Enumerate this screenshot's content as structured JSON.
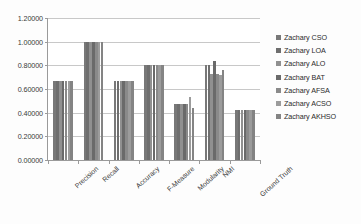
{
  "chart_data": {
    "type": "bar",
    "title": "",
    "xlabel": "",
    "ylabel": "",
    "ylim": [
      0,
      1.2
    ],
    "grid": true,
    "legend_position": "right",
    "categories": [
      "Precision",
      "Recall",
      "Accuracy",
      "F-Measure",
      "Modularity",
      "NMI",
      "Ground Truth"
    ],
    "ytick_labels": [
      "0.00000",
      "0.20000",
      "0.40000",
      "0.60000",
      "0.80000",
      "1.00000",
      "1.20000"
    ],
    "ytick_values": [
      0,
      0.2,
      0.4,
      0.6,
      0.8,
      1.0,
      1.2
    ],
    "series": [
      {
        "name": "Zachary CSO",
        "color": "#787878",
        "values": [
          0.66667,
          1.0,
          0.66667,
          0.8,
          0.47,
          0.8,
          0.425
        ]
      },
      {
        "name": "Zachary LOA",
        "color": "#6e6e6e",
        "values": [
          0.66667,
          1.0,
          0.66667,
          0.8,
          0.47,
          0.8,
          0.425
        ]
      },
      {
        "name": "Zachary ALO",
        "color": "#909090",
        "values": [
          0.66667,
          1.0,
          0.66667,
          0.8,
          0.47,
          0.73,
          0.425
        ]
      },
      {
        "name": "Zachary BAT",
        "color": "#6a6a6a",
        "values": [
          0.66667,
          1.0,
          0.66667,
          0.8,
          0.47,
          0.84,
          0.425
        ]
      },
      {
        "name": "Zachary AFSA",
        "color": "#8a8a8a",
        "values": [
          0.66667,
          1.0,
          0.66667,
          0.8,
          0.47,
          0.73,
          0.425
        ]
      },
      {
        "name": "Zachary ACSO",
        "color": "#9c9c9c",
        "values": [
          0.66667,
          1.0,
          0.66667,
          0.8,
          0.53,
          0.72,
          0.425
        ]
      },
      {
        "name": "Zachary AKHSO",
        "color": "#848484",
        "values": [
          0.66667,
          1.0,
          0.66667,
          0.8,
          0.44,
          0.76,
          0.425
        ]
      }
    ]
  },
  "caption": ""
}
